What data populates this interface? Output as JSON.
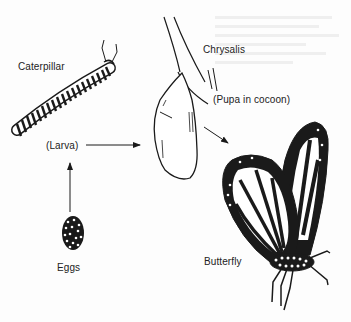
{
  "diagram": {
    "stages": [
      {
        "id": "eggs",
        "label": "Eggs"
      },
      {
        "id": "larva",
        "label": "Caterpillar",
        "sublabel": "(Larva)"
      },
      {
        "id": "pupa",
        "label": "Chrysalis",
        "sublabel": "(Pupa in cocoon)"
      },
      {
        "id": "adult",
        "label": "Butterfly"
      }
    ],
    "arrows": [
      {
        "from": "eggs",
        "to": "larva"
      },
      {
        "from": "larva",
        "to": "pupa"
      },
      {
        "from": "pupa",
        "to": "adult"
      }
    ],
    "colors": {
      "ink": "#1a1a1a",
      "background": "#fdfdfd"
    }
  }
}
